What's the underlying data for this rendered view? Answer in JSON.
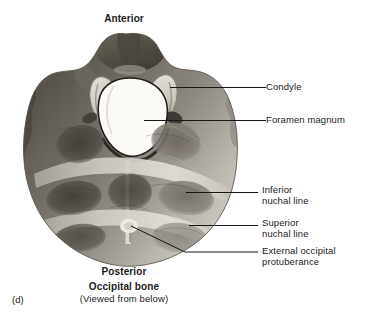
{
  "figure": {
    "panel_letter": "(d)",
    "title": "Occipital bone",
    "subtitle": "(Viewed from below)",
    "orientation_top": "Anterior",
    "orientation_bottom": "Posterior",
    "specimen": "occipital-bone-inferior-view-photograph"
  },
  "callouts": [
    {
      "id": "condyle",
      "label": "Condyle",
      "label2": ""
    },
    {
      "id": "foramen-magnum",
      "label": "Foramen magnum",
      "label2": ""
    },
    {
      "id": "inferior-nuchal-line",
      "label": "Inferior",
      "label2": "nuchal line"
    },
    {
      "id": "superior-nuchal-line",
      "label": "Superior",
      "label2": "nuchal line"
    },
    {
      "id": "external-occipital-protuberance",
      "label": "External occipital",
      "label2": "protuberance"
    }
  ],
  "colors": {
    "background": "#ffffff",
    "text": "#1b1b1b",
    "leader_line": "#161616",
    "bone_light": "#d8d5ce",
    "bone_mid": "#9a968e",
    "bone_dark": "#555049",
    "foramen": "#fdfdfb"
  }
}
